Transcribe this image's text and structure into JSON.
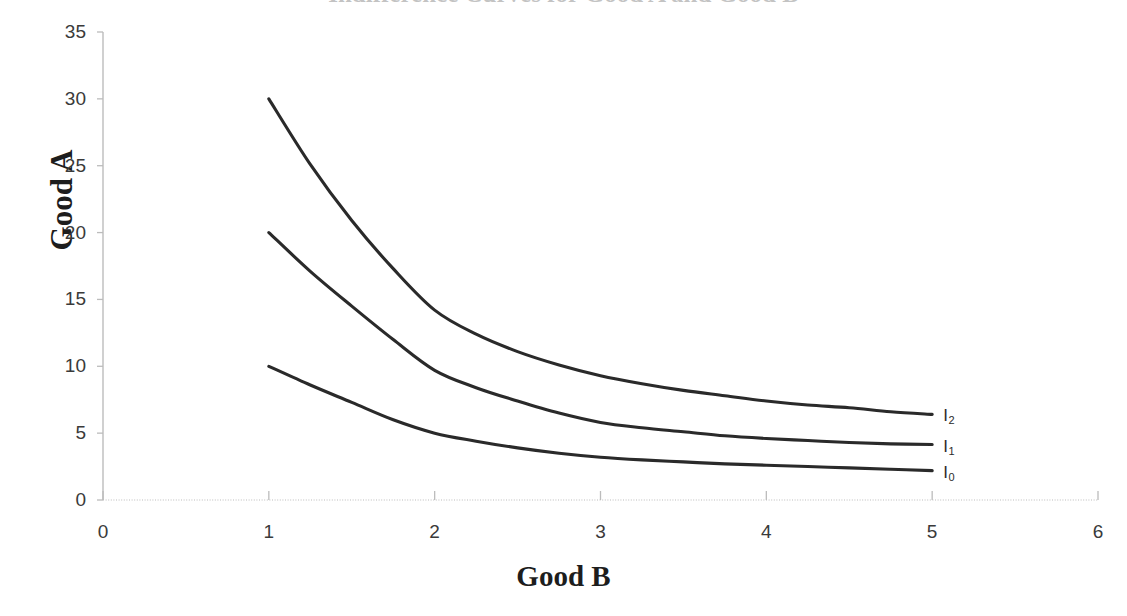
{
  "chart_data": {
    "type": "line",
    "title": "Indifference Curves for Good A and Good B",
    "xlabel": "Good B",
    "ylabel": "Good A",
    "xlim": [
      0,
      6
    ],
    "ylim": [
      0,
      35
    ],
    "xticks": [
      "0",
      "1",
      "2",
      "3",
      "4",
      "5",
      "6"
    ],
    "yticks": [
      "0",
      "5",
      "10",
      "15",
      "20",
      "25",
      "30",
      "35"
    ],
    "grid": false,
    "legend_position": "right-inline-end-of-curve",
    "line_color": "#2a2a2a",
    "axis_color": "#bcbcbc",
    "series": [
      {
        "name": "I2",
        "label": "I",
        "subscript": "2",
        "x": [
          1,
          1.25,
          1.5,
          1.75,
          2,
          2.25,
          2.5,
          2.75,
          3,
          3.25,
          3.5,
          3.75,
          4,
          4.25,
          4.5,
          4.75,
          5
        ],
        "values": [
          30,
          25.1,
          20.9,
          17.3,
          14.2,
          12.4,
          11.1,
          10.1,
          9.3,
          8.7,
          8.2,
          7.8,
          7.4,
          7.1,
          6.9,
          6.6,
          6.4
        ]
      },
      {
        "name": "I1",
        "label": "I",
        "subscript": "1",
        "x": [
          1,
          1.25,
          1.5,
          1.75,
          2,
          2.25,
          2.5,
          2.75,
          3,
          3.25,
          3.5,
          3.75,
          4,
          4.25,
          4.5,
          4.75,
          5
        ],
        "values": [
          20,
          17.1,
          14.5,
          12.0,
          9.7,
          8.4,
          7.4,
          6.5,
          5.8,
          5.4,
          5.1,
          4.8,
          4.6,
          4.45,
          4.3,
          4.2,
          4.15
        ]
      },
      {
        "name": "I0",
        "label": "I",
        "subscript": "0",
        "x": [
          1,
          1.25,
          1.5,
          1.75,
          2,
          2.25,
          2.5,
          2.75,
          3,
          3.25,
          3.5,
          3.75,
          4,
          4.25,
          4.5,
          4.75,
          5
        ],
        "values": [
          10,
          8.6,
          7.3,
          6.0,
          5.0,
          4.4,
          3.9,
          3.5,
          3.2,
          3.0,
          2.85,
          2.7,
          2.6,
          2.5,
          2.4,
          2.3,
          2.2
        ]
      }
    ]
  }
}
